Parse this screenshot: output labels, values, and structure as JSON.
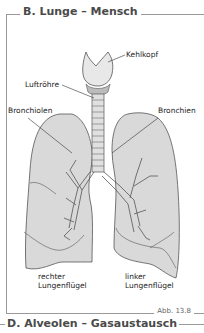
{
  "section_title": "B. Lunge – Mensch",
  "labels": {
    "larynx": "Kehlkopf",
    "trachea": "Luftröhre",
    "bronchioles": "Bronchiolen",
    "bronchi": "Bronchien",
    "right_lung_line1": "rechter",
    "right_lung_line2": "Lungenflügel",
    "left_lung_line1": "linker",
    "left_lung_line2": "Lungenflügel"
  },
  "figure_number": "Abb. 13.8",
  "next_section_title": "D. Alveolen – Gasaustausch",
  "colors": {
    "lung_fill": "#d9d9d9",
    "outline": "#555555",
    "frame": "#9a9a9a",
    "title": "#4a4a4a"
  }
}
